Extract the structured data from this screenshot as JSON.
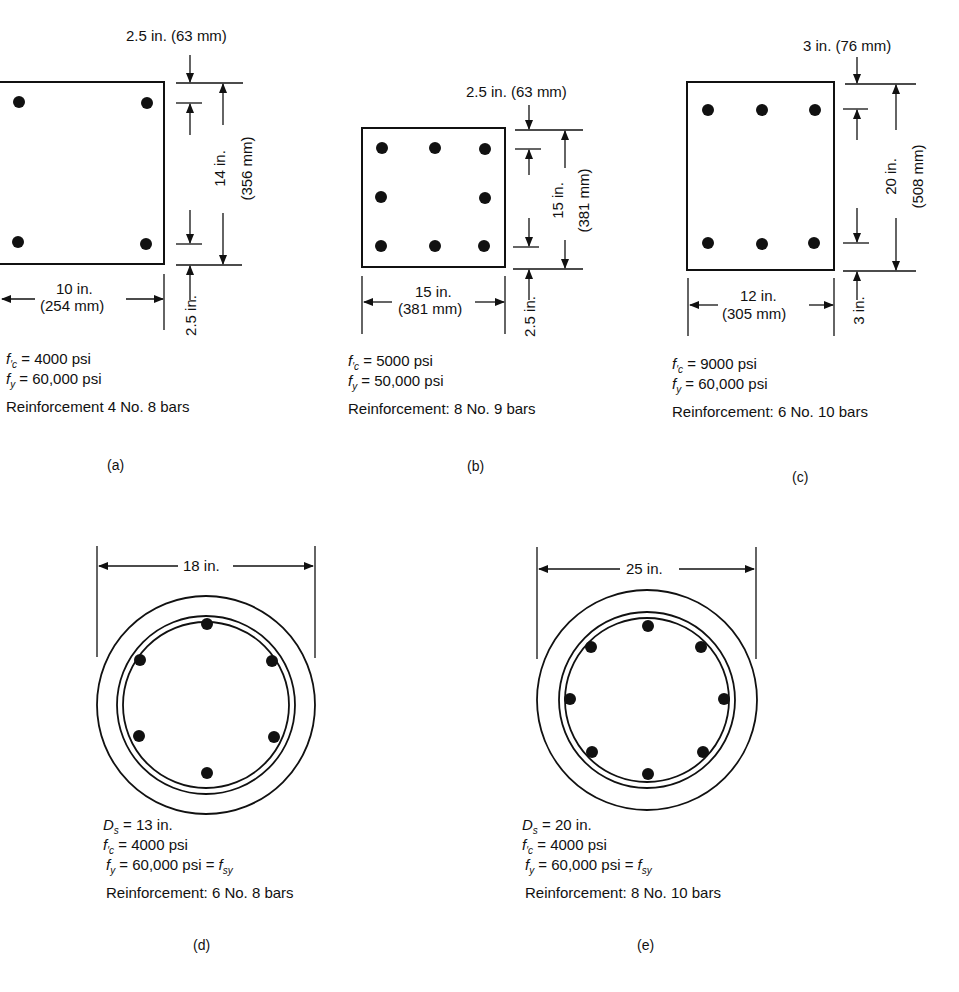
{
  "figure": {
    "panels": [
      {
        "id": "a",
        "label": "(a)",
        "shape": "rectangular",
        "cover_top": "2.5 in. (63 mm)",
        "cover_bottom": "2.5 in.",
        "height_label_1": "14 in.",
        "height_label_2": "(356 mm)",
        "width_label_1": "10 in.",
        "width_label_2": "(254 mm)",
        "fc_value": "= 4000 psi",
        "fy_value": "= 60,000 psi",
        "reinforcement": "Reinforcement 4 No. 8 bars",
        "bar_count": 4
      },
      {
        "id": "b",
        "label": "(b)",
        "shape": "rectangular",
        "cover_top": "2.5 in. (63 mm)",
        "cover_bottom": "2.5 in.",
        "height_label_1": "15 in.",
        "height_label_2": "(381 mm)",
        "width_label_1": "15 in.",
        "width_label_2": "(381 mm)",
        "fc_value": "= 5000 psi",
        "fy_value": "= 50,000 psi",
        "reinforcement": "Reinforcement:  8 No. 9 bars",
        "bar_count": 8
      },
      {
        "id": "c",
        "label": "(c)",
        "shape": "rectangular",
        "cover_top": "3 in. (76 mm)",
        "cover_bottom": "3 in.",
        "height_label_1": "20 in.",
        "height_label_2": "(508 mm)",
        "width_label_1": "12 in.",
        "width_label_2": "(305 mm)",
        "fc_value": "= 9000 psi",
        "fy_value": "= 60,000 psi",
        "reinforcement": "Reinforcement:  6 No. 10 bars",
        "bar_count": 6
      },
      {
        "id": "d",
        "label": "(d)",
        "shape": "circular-spiral",
        "diameter_label": "18 in.",
        "ds_value": "= 13 in.",
        "fc_value": "= 4000 psi",
        "fy_value": "= 60,000  psi =",
        "reinforcement": "Reinforcement:  6 No. 8 bars",
        "bar_count": 6
      },
      {
        "id": "e",
        "label": "(e)",
        "shape": "circular-spiral",
        "diameter_label": "25 in.",
        "ds_value": "= 20 in.",
        "fc_value": "= 4000 psi",
        "fy_value": "= 60,000  psi =",
        "reinforcement": "Reinforcement:  8 No. 10 bars",
        "bar_count": 8
      }
    ],
    "symbols": {
      "f": "f",
      "prime_c": "′c",
      "y": "y",
      "D": "D",
      "s": "s",
      "sy": "sy"
    }
  }
}
